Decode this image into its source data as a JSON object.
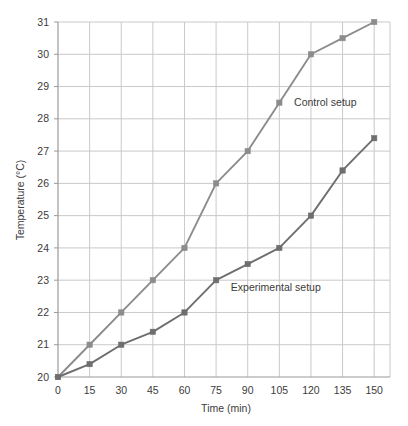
{
  "chart_data": {
    "type": "line",
    "title": "",
    "xlabel": "Time (min)",
    "ylabel": "Temperature (°C)",
    "x": [
      0,
      15,
      30,
      45,
      60,
      75,
      90,
      105,
      120,
      135,
      150
    ],
    "xticks": [
      "0",
      "15",
      "30",
      "45",
      "60",
      "75",
      "90",
      "105",
      "120",
      "135",
      "150"
    ],
    "yticks": [
      "20",
      "21",
      "22",
      "23",
      "24",
      "25",
      "26",
      "27",
      "28",
      "29",
      "30",
      "31"
    ],
    "xlim": [
      0,
      157.5
    ],
    "ylim": [
      19.6,
      31.0
    ],
    "grid": true,
    "legend_position": "inline-annotation",
    "series": [
      {
        "name": "Control setup",
        "color": "#8c8c8c",
        "marker": "square",
        "values": [
          20,
          21,
          22,
          23,
          24,
          26,
          27,
          28.5,
          30,
          30.5,
          31
        ],
        "label_text": "Control setup",
        "label_x": 112,
        "label_y": 28.4
      },
      {
        "name": "Experimental setup",
        "color": "#6e6e6e",
        "marker": "square",
        "values": [
          20,
          20.4,
          21,
          21.4,
          22,
          23,
          23.5,
          24,
          25,
          26.4,
          27.4
        ],
        "label_text": "Experimental setup",
        "label_x": 82,
        "label_y": 22.65
      }
    ]
  },
  "colors": {
    "grid": "#c9c9c9",
    "axis": "#9a9a9a",
    "text": "#3b3b3b",
    "control": "#8c8c8c",
    "experimental": "#6e6e6e",
    "background": "#ffffff"
  }
}
